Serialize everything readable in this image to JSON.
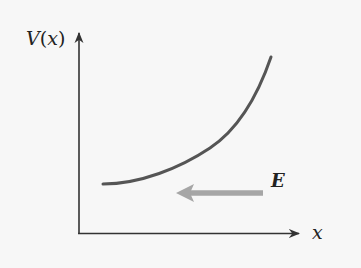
{
  "diagram": {
    "type": "potential-vs-position",
    "y_axis": {
      "label_func": "V",
      "label_open": "(",
      "label_var": "x",
      "label_close": ")"
    },
    "x_axis": {
      "label": "x"
    },
    "curve": {
      "description": "V(x) increasing with x, concave up",
      "color": "#555555"
    },
    "field_arrow": {
      "label": "E",
      "direction": "left (-x)",
      "color": "#a6a6a6"
    },
    "colors": {
      "axes": "#333333",
      "background": "#f7f7f7"
    }
  }
}
